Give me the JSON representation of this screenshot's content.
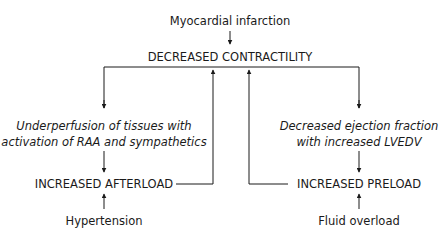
{
  "diagram": {
    "title": "Myocardial infarction",
    "nodes": {
      "cause_top": "Myocardial infarction",
      "center": "DECREASED CONTRACTILITY",
      "left_mechanism": [
        "Underperfusion of tissues with",
        "activation of RAA and sympathetics"
      ],
      "right_mechanism": [
        "Decreased ejection fraction",
        "with increased LVEDV"
      ],
      "left_result": "INCREASED AFTERLOAD",
      "right_result": "INCREASED PRELOAD",
      "left_cause": "Hypertension",
      "right_cause": "Fluid overload"
    },
    "edges": [
      {
        "from": "Myocardial infarction",
        "to": "DECREASED CONTRACTILITY"
      },
      {
        "from": "DECREASED CONTRACTILITY",
        "to": "Underperfusion of tissues with activation of RAA and sympathetics"
      },
      {
        "from": "DECREASED CONTRACTILITY",
        "to": "Decreased ejection fraction with increased LVEDV"
      },
      {
        "from": "Underperfusion of tissues with activation of RAA and sympathetics",
        "to": "INCREASED AFTERLOAD"
      },
      {
        "from": "Decreased ejection fraction with increased LVEDV",
        "to": "INCREASED PRELOAD"
      },
      {
        "from": "Hypertension",
        "to": "INCREASED AFTERLOAD"
      },
      {
        "from": "Fluid overload",
        "to": "INCREASED PRELOAD"
      },
      {
        "from": "INCREASED AFTERLOAD",
        "to": "DECREASED CONTRACTILITY"
      },
      {
        "from": "INCREASED PRELOAD",
        "to": "DECREASED CONTRACTILITY"
      }
    ],
    "line_color": "#1a1a1a"
  }
}
